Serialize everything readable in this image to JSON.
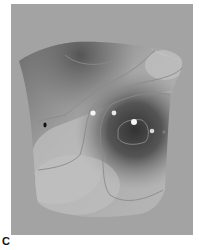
{
  "figure": {
    "panel_label": "C",
    "colors": {
      "background": "#a3a3a3",
      "surface_light": "#c4c4c4",
      "surface_dark": "#3f3f3f",
      "contour": "#8a8a8a",
      "marker_white": "#f4f4f4",
      "marker_black": "#111111"
    },
    "markers": [
      {
        "type": "white",
        "x": 93,
        "y": 113
      },
      {
        "type": "white",
        "x": 114,
        "y": 113
      },
      {
        "type": "white",
        "x": 134,
        "y": 122
      },
      {
        "type": "white",
        "x": 152,
        "y": 131
      },
      {
        "type": "black",
        "x": 45,
        "y": 125
      }
    ]
  }
}
